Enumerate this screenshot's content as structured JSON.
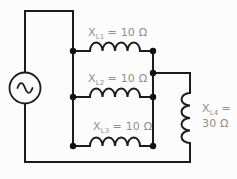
{
  "circuit": {
    "description": "AC source with three parallel inductive reactances in series with a fourth inductor",
    "source": {
      "kind": "ac-source",
      "symbol": "sine-wave"
    },
    "inductors": [
      {
        "id": "L1",
        "label_main": "X",
        "label_sub": "L1",
        "label_value": "= 10 Ω"
      },
      {
        "id": "L2",
        "label_main": "X",
        "label_sub": "L2",
        "label_value": "= 10 Ω"
      },
      {
        "id": "L3",
        "label_main": "X",
        "label_sub": "L3",
        "label_value": "= 10 Ω"
      },
      {
        "id": "L4",
        "label_main": "X",
        "label_sub": "L4",
        "label_value": "=",
        "label_value_line2": "30 Ω"
      }
    ],
    "junction_dot_count": 7,
    "colors": {
      "line": "#1c1c1c",
      "label_text": "#8f8f8f",
      "background": "#fcfcfc"
    }
  }
}
